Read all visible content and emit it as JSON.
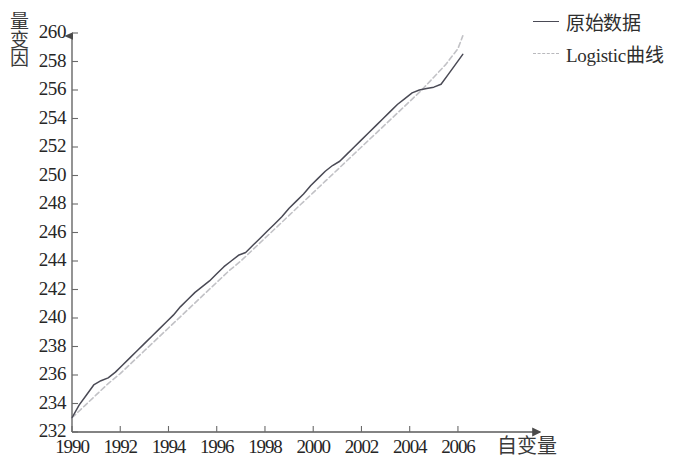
{
  "chart_data": {
    "type": "line",
    "title": "",
    "xlabel": "自变量",
    "ylabel": "因变量",
    "ylabel_chars": [
      "因",
      "变",
      "量"
    ],
    "xlim": [
      1990,
      2006.5
    ],
    "ylim": [
      232,
      260
    ],
    "grid": false,
    "legend_position": "top-right",
    "xticks": [
      "1990",
      "1992",
      "1994",
      "1996",
      "1998",
      "2000",
      "2002",
      "2004",
      "2006"
    ],
    "xtick_values": [
      1990,
      1992,
      1994,
      1996,
      1998,
      2000,
      2002,
      2004,
      2006
    ],
    "yticks": [
      "260",
      "258",
      "256",
      "254",
      "252",
      "250",
      "248",
      "246",
      "244",
      "242",
      "240",
      "238",
      "236",
      "234",
      "232"
    ],
    "ytick_values": [
      260,
      258,
      256,
      254,
      252,
      250,
      248,
      246,
      244,
      242,
      240,
      238,
      236,
      234,
      232
    ],
    "colors": {
      "observed": "#4a4a55",
      "fitted": "#c2c2c6",
      "axis": "#5a5a5a",
      "text": "#262626"
    },
    "series": [
      {
        "name": "原始数据",
        "style": "solid",
        "color": "#4a4a55",
        "x": [
          1990.0,
          1990.3,
          1990.6,
          1990.9,
          1991.2,
          1991.5,
          1991.8,
          1992.1,
          1992.4,
          1992.7,
          1993.0,
          1993.3,
          1993.6,
          1993.9,
          1994.2,
          1994.5,
          1994.8,
          1995.1,
          1995.4,
          1995.7,
          1996.0,
          1996.3,
          1996.6,
          1996.9,
          1997.2,
          1997.5,
          1997.8,
          1998.1,
          1998.4,
          1998.7,
          1999.0,
          1999.3,
          1999.6,
          1999.9,
          2000.2,
          2000.5,
          2000.8,
          2001.1,
          2001.4,
          2001.7,
          2002.0,
          2002.3,
          2002.6,
          2002.9,
          2003.2,
          2003.5,
          2003.8,
          2004.1,
          2004.4,
          2004.7,
          2005.0,
          2005.3,
          2005.6,
          2005.9,
          2006.2
        ],
        "y": [
          233.0,
          233.9,
          234.6,
          235.3,
          235.6,
          235.8,
          236.2,
          236.7,
          237.2,
          237.7,
          238.2,
          238.7,
          239.2,
          239.7,
          240.2,
          240.8,
          241.3,
          241.8,
          242.2,
          242.6,
          243.1,
          243.6,
          244.0,
          244.4,
          244.6,
          245.1,
          245.6,
          246.1,
          246.6,
          247.1,
          247.7,
          248.2,
          248.7,
          249.3,
          249.8,
          250.3,
          250.7,
          251.0,
          251.5,
          252.0,
          252.5,
          253.0,
          253.5,
          254.0,
          254.5,
          255.0,
          255.4,
          255.8,
          256.0,
          256.1,
          256.2,
          256.4,
          257.1,
          257.8,
          258.5
        ]
      },
      {
        "name": "Logistic曲线",
        "style": "dashed",
        "color": "#c2c2c6",
        "x": [
          1990.0,
          1990.5,
          1991.0,
          1991.5,
          1992.0,
          1992.5,
          1993.0,
          1993.5,
          1994.0,
          1994.5,
          1995.0,
          1995.5,
          1996.0,
          1996.5,
          1997.0,
          1997.5,
          1998.0,
          1998.5,
          1999.0,
          1999.5,
          2000.0,
          2000.5,
          2001.0,
          2001.5,
          2002.0,
          2002.5,
          2003.0,
          2003.5,
          2004.0,
          2004.5,
          2005.0,
          2005.5,
          2006.0,
          2006.2
        ],
        "y": [
          233.0,
          233.8,
          234.6,
          235.4,
          236.1,
          236.9,
          237.7,
          238.5,
          239.3,
          240.1,
          240.9,
          241.7,
          242.5,
          243.3,
          244.0,
          244.8,
          245.6,
          246.4,
          247.2,
          248.0,
          248.8,
          249.6,
          250.4,
          251.2,
          252.0,
          252.8,
          253.6,
          254.4,
          255.2,
          256.0,
          256.9,
          257.8,
          258.9,
          259.8
        ]
      }
    ]
  },
  "legend": {
    "items": [
      {
        "label": "原始数据",
        "style": "solid"
      },
      {
        "label": "Logistic曲线",
        "style": "dashed"
      }
    ]
  }
}
